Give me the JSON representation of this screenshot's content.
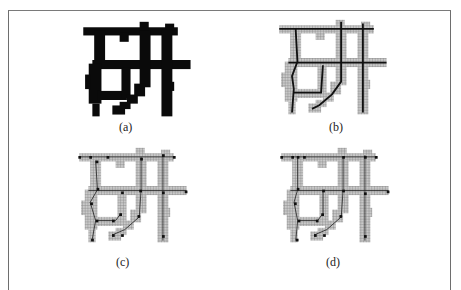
{
  "figure": {
    "character": "研",
    "panels": [
      {
        "id": "a",
        "label": "(a)",
        "description": "binary character image"
      },
      {
        "id": "b",
        "label": "(b)",
        "description": "thinned skeleton over gridded stroke area"
      },
      {
        "id": "c",
        "label": "(c)",
        "description": "skeleton with feature points"
      },
      {
        "id": "d",
        "label": "(d)",
        "description": "refined skeleton with feature points"
      }
    ]
  },
  "colors": {
    "ink": "#0a0a0a",
    "grid_fill": "#b5b5b5",
    "skeleton": "#111111",
    "border": "#6e6e6e"
  }
}
